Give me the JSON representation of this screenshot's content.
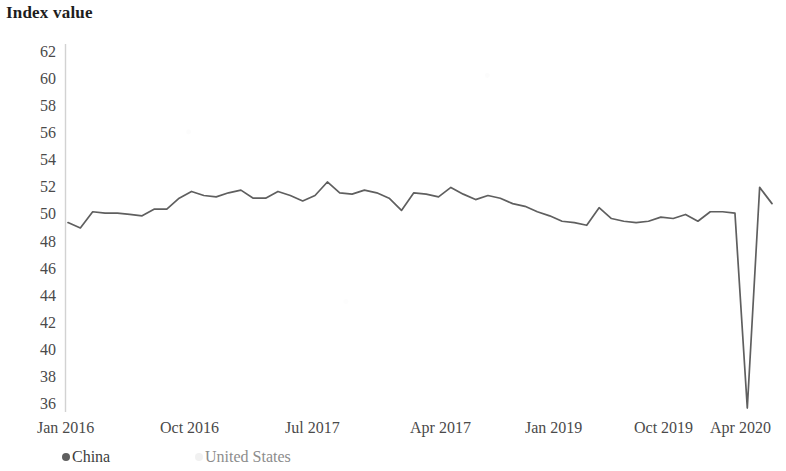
{
  "chart_data": {
    "type": "line",
    "title": "Index value",
    "xlabel": "",
    "ylabel": "Index value",
    "ylim": [
      35,
      63
    ],
    "yticks": [
      36,
      38,
      40,
      42,
      44,
      46,
      48,
      50,
      52,
      54,
      56,
      58,
      60,
      62
    ],
    "xticks": [
      "Jan 2016",
      "Oct 2016",
      "Jul 2017",
      "Apr 2017",
      "Jan 2019",
      "Oct 2019",
      "Apr 2020"
    ],
    "grid": false,
    "legend_position": "bottom-left",
    "legend": [
      "China",
      "United States"
    ],
    "colors": {
      "china": "#5f5f5f",
      "united_states": "#c9c9c9"
    },
    "series": [
      {
        "name": "China",
        "color": "#5f5f5f",
        "values": [
          49.4,
          49.0,
          50.2,
          50.1,
          50.1,
          50.0,
          49.9,
          50.4,
          50.4,
          51.2,
          51.7,
          51.4,
          51.3,
          51.6,
          51.8,
          51.2,
          51.2,
          51.7,
          51.4,
          51.0,
          51.4,
          52.4,
          51.6,
          51.5,
          51.8,
          51.6,
          51.2,
          50.3,
          51.6,
          51.5,
          51.3,
          52.0,
          51.5,
          51.1,
          51.4,
          51.2,
          50.8,
          50.6,
          50.2,
          49.9,
          49.5,
          49.4,
          49.2,
          50.5,
          49.7,
          49.5,
          49.4,
          49.5,
          49.8,
          49.7,
          50.0,
          49.5,
          50.2,
          50.2,
          50.1,
          35.7,
          52.0,
          50.8
        ]
      },
      {
        "name": "United States",
        "color": "#c9c9c9",
        "values": []
      }
    ],
    "annotations": [
      {
        "text": "sharp collapse to 35.7",
        "value": 35.7
      },
      {
        "text": "rebound peak 52.0",
        "value": 52.0
      },
      {
        "text": "final value 50.8",
        "value": 50.8
      }
    ]
  },
  "axis": {
    "y_labels": [
      "62",
      "60",
      "58",
      "56",
      "54",
      "52",
      "50",
      "48",
      "46",
      "44",
      "42",
      "40",
      "38",
      "36"
    ],
    "x_labels": [
      "Jan 2016",
      "Oct 2016",
      "Jul 2017",
      "Apr 2017",
      "Jan 2019",
      "Oct 2019",
      "Apr 2020"
    ]
  },
  "legend": {
    "china": "China",
    "united_states": "United States"
  }
}
